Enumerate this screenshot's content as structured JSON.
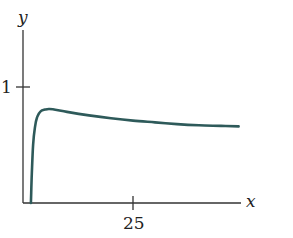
{
  "chart_data": {
    "type": "line",
    "title": "",
    "xlabel": "x",
    "ylabel": "y",
    "x_ticks": [
      25
    ],
    "y_ticks": [
      1
    ],
    "xlim": [
      0,
      49
    ],
    "ylim": [
      0,
      1.5
    ],
    "grid": false,
    "legend": null,
    "series": [
      {
        "name": "curve",
        "color": "#2e5a5a",
        "x": [
          1.8,
          2.0,
          2.3,
          2.7,
          3.2,
          4.0,
          5.0,
          6.0,
          8.0,
          10.0,
          15.0,
          20.0,
          25.0,
          30.0,
          35.0,
          40.0,
          45.0,
          49.0
        ],
        "y": [
          0.0,
          0.25,
          0.5,
          0.65,
          0.74,
          0.79,
          0.805,
          0.81,
          0.8,
          0.785,
          0.755,
          0.73,
          0.71,
          0.695,
          0.68,
          0.67,
          0.665,
          0.66
        ]
      }
    ]
  },
  "labels": {
    "y_axis": "y",
    "x_axis": "x",
    "y_tick_1": "1",
    "x_tick_25": "25"
  }
}
